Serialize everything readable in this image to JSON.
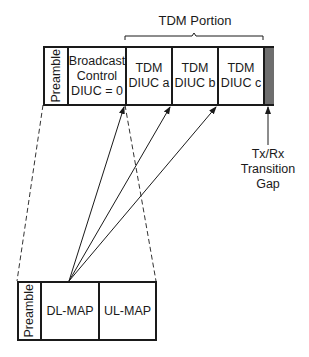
{
  "tdm_portion": {
    "label": "TDM Portion"
  },
  "top_frame": {
    "cells": [
      {
        "id": "preamble",
        "label": "Preamble",
        "orientation": "vertical"
      },
      {
        "id": "broadcast",
        "lines": [
          "Broadcast",
          "Control",
          "DIUC = 0"
        ]
      },
      {
        "id": "tdm-a",
        "lines": [
          "TDM",
          "DIUC a"
        ]
      },
      {
        "id": "tdm-b",
        "lines": [
          "TDM",
          "DIUC b"
        ]
      },
      {
        "id": "tdm-c",
        "lines": [
          "TDM",
          "DIUC c"
        ]
      },
      {
        "id": "gap",
        "label": "",
        "fill": "#6e6e6e"
      }
    ]
  },
  "gap_label": {
    "lines": [
      "Tx/Rx",
      "Transition",
      "Gap"
    ]
  },
  "bottom_frame": {
    "cells": [
      {
        "id": "preamble",
        "label": "Preamble",
        "orientation": "vertical"
      },
      {
        "id": "dl-map",
        "label": "DL-MAP"
      },
      {
        "id": "ul-map",
        "label": "UL-MAP"
      }
    ]
  },
  "colors": {
    "line": "#1a1a1a",
    "gap_fill": "#6e6e6e",
    "background": "#ffffff"
  }
}
